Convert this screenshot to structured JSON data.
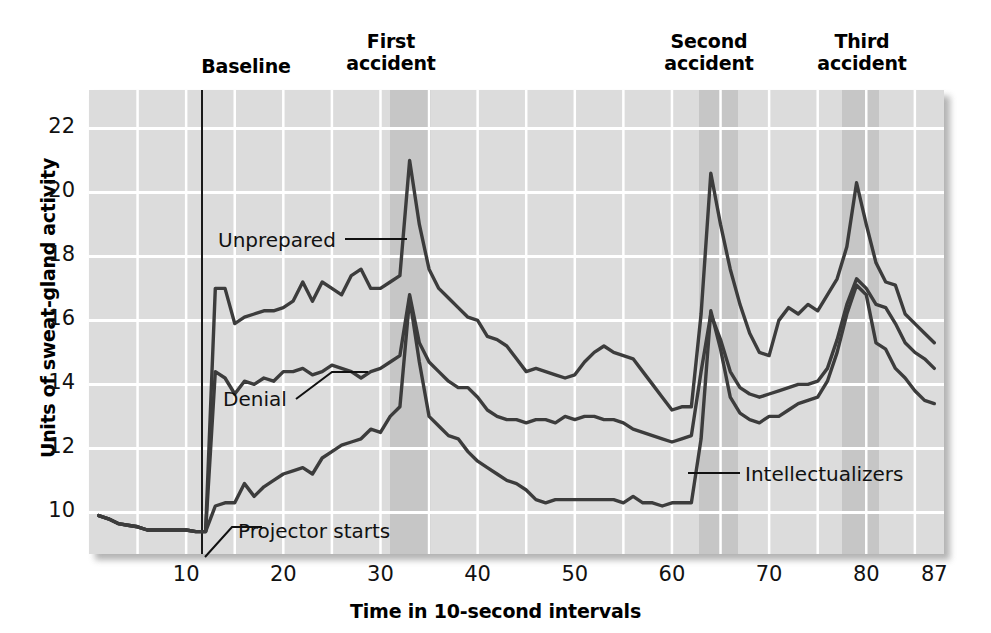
{
  "figure": {
    "y_axis_title": "Units of sweat-gland activity",
    "x_axis_title": "Time in 10-second intervals",
    "section_labels": [
      {
        "name": "baseline",
        "text": "Baseline",
        "x": 246,
        "y": 55
      },
      {
        "name": "first-accident",
        "text": "First\naccident",
        "x": 391,
        "y": 30
      },
      {
        "name": "second-accident",
        "text": "Second\naccident",
        "x": 709,
        "y": 30
      },
      {
        "name": "third-accident",
        "text": "Third\naccident",
        "x": 862,
        "y": 30
      }
    ],
    "annotations": [
      {
        "name": "unprepared",
        "text": "Unprepared",
        "x": 218,
        "y": 228
      },
      {
        "name": "denial",
        "text": "Denial",
        "x": 223,
        "y": 387
      },
      {
        "name": "intellectualizers",
        "text": "Intellectualizers",
        "x": 745,
        "y": 462
      },
      {
        "name": "projector-starts",
        "text": "Projector starts",
        "x": 238,
        "y": 519
      }
    ],
    "colors": {
      "plot_background": "#dcdcdc",
      "band_shade": "#c6c6c6",
      "gridline": "#ffffff",
      "line": "#3c3c3c",
      "text": "#111111"
    }
  },
  "chart_data": {
    "type": "line",
    "title": "",
    "xlabel": "Time in 10-second intervals",
    "ylabel": "Units of sweat-gland activity",
    "xlim": [
      0,
      88
    ],
    "ylim": [
      8.7,
      23.2
    ],
    "xticks": [
      10,
      20,
      30,
      40,
      50,
      60,
      70,
      80,
      87
    ],
    "yticks": [
      10,
      12,
      14,
      16,
      18,
      20,
      22
    ],
    "grid": true,
    "legend": "inline-annotations",
    "event_markers": [
      {
        "label": "Projector starts",
        "x": 11.5,
        "type": "vertical-line"
      }
    ],
    "shaded_regions": [
      {
        "label": "First accident",
        "x_start": 31.0,
        "x_end": 35.2
      },
      {
        "label": "Second accident",
        "x_start": 62.8,
        "x_end": 66.8
      },
      {
        "label": "Third accident",
        "x_start": 77.5,
        "x_end": 81.3
      }
    ],
    "x": [
      1,
      2,
      3,
      4,
      5,
      6,
      7,
      8,
      9,
      10,
      11,
      12,
      13,
      14,
      15,
      16,
      17,
      18,
      19,
      20,
      21,
      22,
      23,
      24,
      25,
      26,
      27,
      28,
      29,
      30,
      31,
      32,
      33,
      34,
      35,
      36,
      37,
      38,
      39,
      40,
      41,
      42,
      43,
      44,
      45,
      46,
      47,
      48,
      49,
      50,
      51,
      52,
      53,
      54,
      55,
      56,
      57,
      58,
      59,
      60,
      61,
      62,
      63,
      64,
      65,
      66,
      67,
      68,
      69,
      70,
      71,
      72,
      73,
      74,
      75,
      76,
      77,
      78,
      79,
      80,
      81,
      82,
      83,
      84,
      85,
      86,
      87
    ],
    "series": [
      {
        "name": "Unprepared",
        "values": [
          9.9,
          9.8,
          9.65,
          9.6,
          9.55,
          9.45,
          9.45,
          9.45,
          9.45,
          9.45,
          9.4,
          9.4,
          17.0,
          17.0,
          15.9,
          16.1,
          16.2,
          16.3,
          16.3,
          16.4,
          16.6,
          17.2,
          16.6,
          17.2,
          17.0,
          16.8,
          17.4,
          17.6,
          17.0,
          17.0,
          17.2,
          17.4,
          21.0,
          19.0,
          17.6,
          17.0,
          16.7,
          16.4,
          16.1,
          16.0,
          15.5,
          15.4,
          15.2,
          14.8,
          14.4,
          14.5,
          14.4,
          14.3,
          14.2,
          14.3,
          14.7,
          15.0,
          15.2,
          15.0,
          14.9,
          14.8,
          14.4,
          14.0,
          13.6,
          13.2,
          13.3,
          13.3,
          16.2,
          20.6,
          19.0,
          17.6,
          16.5,
          15.6,
          15.0,
          14.9,
          16.0,
          16.4,
          16.2,
          16.5,
          16.3,
          16.8,
          17.3,
          18.3,
          20.3,
          19.0,
          17.8,
          17.2,
          17.1,
          16.2,
          15.9,
          15.6,
          15.3
        ]
      },
      {
        "name": "Denial",
        "values": [
          9.9,
          9.8,
          9.65,
          9.6,
          9.55,
          9.45,
          9.45,
          9.45,
          9.45,
          9.45,
          9.4,
          9.4,
          14.4,
          14.2,
          13.7,
          14.1,
          14.0,
          14.2,
          14.1,
          14.4,
          14.4,
          14.5,
          14.3,
          14.4,
          14.6,
          14.5,
          14.4,
          14.2,
          14.4,
          14.5,
          14.7,
          14.9,
          16.8,
          15.3,
          14.7,
          14.4,
          14.1,
          13.9,
          13.9,
          13.6,
          13.2,
          13.0,
          12.9,
          12.9,
          12.8,
          12.9,
          12.9,
          12.8,
          13.0,
          12.9,
          13.0,
          13.0,
          12.9,
          12.9,
          12.8,
          12.6,
          12.5,
          12.4,
          12.3,
          12.2,
          12.3,
          12.4,
          14.4,
          16.2,
          15.4,
          14.4,
          13.9,
          13.7,
          13.6,
          13.7,
          13.8,
          13.9,
          14.0,
          14.0,
          14.1,
          14.5,
          15.4,
          16.5,
          17.3,
          17.0,
          16.5,
          16.4,
          15.9,
          15.3,
          15.0,
          14.8,
          14.5
        ]
      },
      {
        "name": "Intellectualizers",
        "values": [
          9.9,
          9.8,
          9.65,
          9.6,
          9.55,
          9.45,
          9.45,
          9.45,
          9.45,
          9.45,
          9.4,
          9.4,
          10.2,
          10.3,
          10.3,
          10.9,
          10.5,
          10.8,
          11.0,
          11.2,
          11.3,
          11.4,
          11.2,
          11.7,
          11.9,
          12.1,
          12.2,
          12.3,
          12.6,
          12.5,
          13.0,
          13.3,
          16.7,
          14.7,
          13.0,
          12.7,
          12.4,
          12.3,
          11.9,
          11.6,
          11.4,
          11.2,
          11.0,
          10.9,
          10.7,
          10.4,
          10.3,
          10.4,
          10.4,
          10.4,
          10.4,
          10.4,
          10.4,
          10.4,
          10.3,
          10.5,
          10.3,
          10.3,
          10.2,
          10.3,
          10.3,
          10.3,
          12.3,
          16.3,
          15.1,
          13.6,
          13.1,
          12.9,
          12.8,
          13.0,
          13.0,
          13.2,
          13.4,
          13.5,
          13.6,
          14.1,
          15.0,
          16.2,
          17.1,
          16.8,
          15.3,
          15.1,
          14.5,
          14.2,
          13.8,
          13.5,
          13.4
        ]
      }
    ]
  }
}
